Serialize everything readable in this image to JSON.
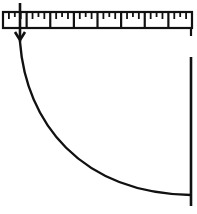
{
  "diagram": {
    "canvas": {
      "width": 197,
      "height": 214,
      "background": "#ffffff"
    },
    "stroke_color": "#111111",
    "ruler": {
      "x": 3,
      "y": 12,
      "width": 189,
      "height": 16,
      "segments": 8,
      "minor_ticks_per_segment": 3
    },
    "arrow": {
      "x": 20,
      "y_start": 3,
      "y_end": 42,
      "direction": "down"
    },
    "curve": {
      "start": [
        20,
        42
      ],
      "end": [
        191,
        195
      ],
      "shape": "quarter-arc"
    },
    "vertical_line": {
      "x": 191,
      "y_start": 57,
      "y_end": 206
    },
    "ruler_end_tick": {
      "x": 191,
      "y_start": 28,
      "y_end": 36
    }
  }
}
